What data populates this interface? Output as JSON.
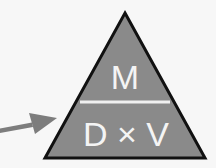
{
  "diagram": {
    "type": "formula-triangle",
    "top_label": "M",
    "bottom_left_label": "D",
    "operator": "×",
    "bottom_right_label": "V",
    "bottom_label": "D × V",
    "fill_color": "#8a8a8a",
    "outline_color": "#111111",
    "divider_color": "#f0f0f0",
    "arrow_color": "#7d7d7d"
  }
}
